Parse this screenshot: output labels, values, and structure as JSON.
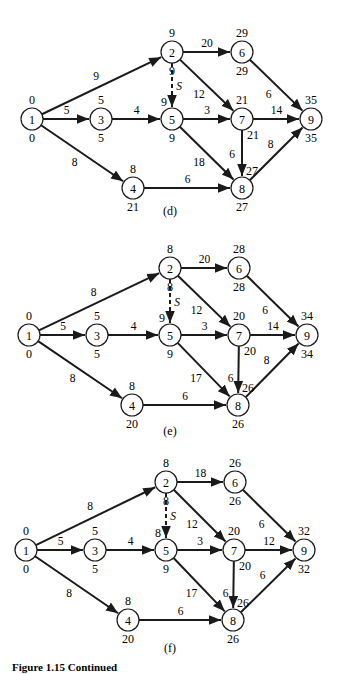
{
  "figure_caption": "Figure 1.15 Continued",
  "dummy_label": "S",
  "diagrams": [
    {
      "id": "d",
      "caption": "(d)",
      "nodes": [
        {
          "id": "1",
          "x": 32,
          "y": 119,
          "early": "0",
          "late": "0"
        },
        {
          "id": "2",
          "x": 172,
          "y": 52,
          "early": "9",
          "late": "9"
        },
        {
          "id": "3",
          "x": 101,
          "y": 119,
          "early": "5",
          "late": "5"
        },
        {
          "id": "4",
          "x": 133,
          "y": 188,
          "early": "8",
          "late": "21"
        },
        {
          "id": "5",
          "x": 172,
          "y": 119,
          "early": "9",
          "late": "9"
        },
        {
          "id": "6",
          "x": 242,
          "y": 52,
          "early": "29",
          "late": "29"
        },
        {
          "id": "7",
          "x": 242,
          "y": 119,
          "early": "21",
          "late": "21"
        },
        {
          "id": "8",
          "x": 242,
          "y": 188,
          "early": "27",
          "late": "27"
        },
        {
          "id": "9",
          "x": 311,
          "y": 119,
          "early": "35",
          "late": "35"
        }
      ],
      "edges": [
        {
          "from": "1",
          "to": "2",
          "weight": "9"
        },
        {
          "from": "1",
          "to": "3",
          "weight": "5"
        },
        {
          "from": "1",
          "to": "4",
          "weight": "8"
        },
        {
          "from": "2",
          "to": "6",
          "weight": "20"
        },
        {
          "from": "2",
          "to": "5",
          "weight": "",
          "dummy": true
        },
        {
          "from": "2",
          "to": "7",
          "weight": "12"
        },
        {
          "from": "3",
          "to": "5",
          "weight": "4"
        },
        {
          "from": "5",
          "to": "7",
          "weight": "3"
        },
        {
          "from": "5",
          "to": "8",
          "weight": "18"
        },
        {
          "from": "6",
          "to": "9",
          "weight": "6"
        },
        {
          "from": "7",
          "to": "9",
          "weight": "14"
        },
        {
          "from": "7",
          "to": "8",
          "weight": "6"
        },
        {
          "from": "4",
          "to": "8",
          "weight": "6"
        },
        {
          "from": "8",
          "to": "9",
          "weight": "8"
        }
      ]
    },
    {
      "id": "e",
      "caption": "(e)",
      "nodes": [
        {
          "id": "1",
          "x": 29,
          "y": 335,
          "early": "0",
          "late": "0"
        },
        {
          "id": "2",
          "x": 170,
          "y": 268,
          "early": "8",
          "late": "8"
        },
        {
          "id": "3",
          "x": 97,
          "y": 335,
          "early": "5",
          "late": "5"
        },
        {
          "id": "4",
          "x": 132,
          "y": 405,
          "early": "8",
          "late": "20"
        },
        {
          "id": "5",
          "x": 170,
          "y": 335,
          "early": "9",
          "late": "9"
        },
        {
          "id": "6",
          "x": 239,
          "y": 268,
          "early": "28",
          "late": "28"
        },
        {
          "id": "7",
          "x": 239,
          "y": 335,
          "early": "20",
          "late": "20"
        },
        {
          "id": "8",
          "x": 238,
          "y": 405,
          "early": "26",
          "late": "26"
        },
        {
          "id": "9",
          "x": 307,
          "y": 335,
          "early": "34",
          "late": "34"
        }
      ],
      "edges": [
        {
          "from": "1",
          "to": "2",
          "weight": "8"
        },
        {
          "from": "1",
          "to": "3",
          "weight": "5"
        },
        {
          "from": "1",
          "to": "4",
          "weight": "8"
        },
        {
          "from": "2",
          "to": "6",
          "weight": "20"
        },
        {
          "from": "2",
          "to": "5",
          "weight": "",
          "dummy": true
        },
        {
          "from": "2",
          "to": "7",
          "weight": "12"
        },
        {
          "from": "3",
          "to": "5",
          "weight": "4"
        },
        {
          "from": "5",
          "to": "7",
          "weight": "3"
        },
        {
          "from": "5",
          "to": "8",
          "weight": "17"
        },
        {
          "from": "6",
          "to": "9",
          "weight": "6"
        },
        {
          "from": "7",
          "to": "9",
          "weight": "14"
        },
        {
          "from": "7",
          "to": "8",
          "weight": "6"
        },
        {
          "from": "4",
          "to": "8",
          "weight": "6"
        },
        {
          "from": "8",
          "to": "9",
          "weight": "8"
        }
      ]
    },
    {
      "id": "f",
      "caption": "(f)",
      "nodes": [
        {
          "id": "1",
          "x": 26,
          "y": 550,
          "early": "0",
          "late": "0"
        },
        {
          "id": "2",
          "x": 166,
          "y": 482,
          "early": "8",
          "late": "8"
        },
        {
          "id": "3",
          "x": 95,
          "y": 550,
          "early": "5",
          "late": "5"
        },
        {
          "id": "4",
          "x": 128,
          "y": 620,
          "early": "8",
          "late": "20"
        },
        {
          "id": "5",
          "x": 166,
          "y": 550,
          "early": "8",
          "late": "9"
        },
        {
          "id": "6",
          "x": 235,
          "y": 482,
          "early": "26",
          "late": "26"
        },
        {
          "id": "7",
          "x": 234,
          "y": 550,
          "early": "20",
          "late": "20"
        },
        {
          "id": "8",
          "x": 233,
          "y": 620,
          "early": "26",
          "late": "26"
        },
        {
          "id": "9",
          "x": 304,
          "y": 550,
          "early": "32",
          "late": "32"
        }
      ],
      "edges": [
        {
          "from": "1",
          "to": "2",
          "weight": "8"
        },
        {
          "from": "1",
          "to": "3",
          "weight": "5"
        },
        {
          "from": "1",
          "to": "4",
          "weight": "8"
        },
        {
          "from": "2",
          "to": "6",
          "weight": "18"
        },
        {
          "from": "2",
          "to": "5",
          "weight": "",
          "dummy": true
        },
        {
          "from": "2",
          "to": "7",
          "weight": "12"
        },
        {
          "from": "3",
          "to": "5",
          "weight": "4"
        },
        {
          "from": "5",
          "to": "7",
          "weight": "3"
        },
        {
          "from": "5",
          "to": "8",
          "weight": "17"
        },
        {
          "from": "6",
          "to": "9",
          "weight": "6"
        },
        {
          "from": "7",
          "to": "9",
          "weight": "12"
        },
        {
          "from": "7",
          "to": "8",
          "weight": "6"
        },
        {
          "from": "4",
          "to": "8",
          "weight": "6"
        },
        {
          "from": "8",
          "to": "9",
          "weight": "6"
        }
      ]
    }
  ],
  "colors": {
    "ink": "#1a1a1a",
    "background": "#ffffff"
  }
}
